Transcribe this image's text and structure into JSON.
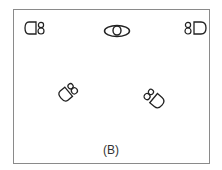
{
  "figure": {
    "caption": "(B)",
    "border_color": "#8a8a8a",
    "stroke_color": "#222222"
  },
  "elements": [
    {
      "name": "speaker-top-left",
      "icon": "speaker-icon",
      "x": 24,
      "y": 21,
      "rotation": 0,
      "facing": "left"
    },
    {
      "name": "center-target",
      "icon": "oval-target-icon",
      "x": 104,
      "y": 24
    },
    {
      "name": "speaker-top-right",
      "icon": "speaker-icon",
      "x": 184,
      "y": 21,
      "rotation": 0,
      "facing": "right"
    },
    {
      "name": "speaker-middle-left",
      "icon": "speaker-icon",
      "x": 58,
      "y": 78,
      "rotation": -45
    },
    {
      "name": "speaker-middle-right",
      "icon": "speaker-icon",
      "x": 146,
      "y": 86,
      "rotation": 45
    }
  ]
}
